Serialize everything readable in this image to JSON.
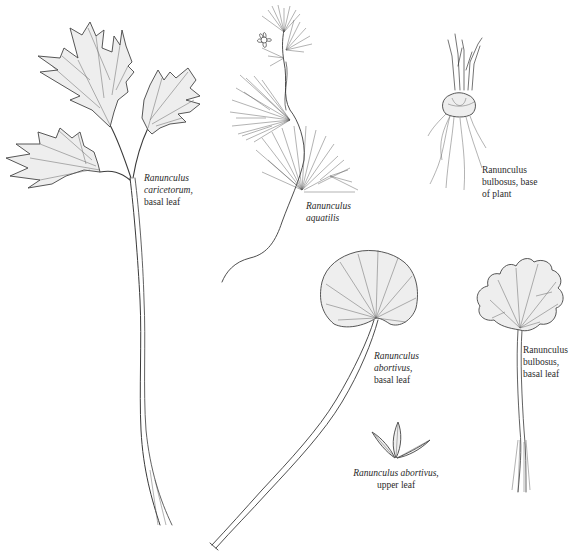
{
  "plate": {
    "background": "#ffffff",
    "ink_color": "#3a3a3a"
  },
  "specimens": [
    {
      "id": "caricetorum",
      "label_lines": [
        "Ranunculus",
        "caricetorum,",
        "basal leaf"
      ],
      "italic_lines": [
        0,
        1
      ],
      "icon": "compound-toothed-leaf-icon"
    },
    {
      "id": "aquatilis",
      "label_lines": [
        "Ranunculus",
        "aquatilis"
      ],
      "italic_lines": [
        0,
        1
      ],
      "icon": "aquatic-buttercup-icon"
    },
    {
      "id": "bulbosus-base",
      "label_lines": [
        "Ranunculus",
        "bulbosus, base",
        "of plant"
      ],
      "italic_lines": [],
      "icon": "bulb-with-roots-icon"
    },
    {
      "id": "abortivus-basal",
      "label_lines": [
        "Ranunculus",
        "abortivus,",
        "basal leaf"
      ],
      "italic_lines": [
        0,
        1
      ],
      "icon": "reniform-leaf-icon"
    },
    {
      "id": "bulbosus-basal",
      "label_lines": [
        "Ranunculus",
        "bulbosus,",
        "basal leaf"
      ],
      "italic_lines": [],
      "icon": "lobed-leaf-icon"
    },
    {
      "id": "abortivus-upper",
      "label_lines": [
        "Ranunculus abortivus,",
        "upper leaf"
      ],
      "italic_lines": [
        0
      ],
      "icon": "three-lanceolate-leaflets-icon"
    }
  ]
}
